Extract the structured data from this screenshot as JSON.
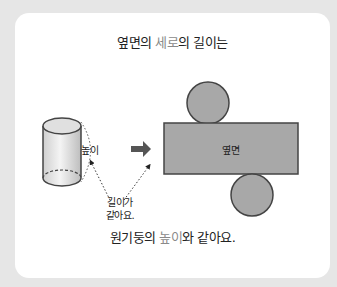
{
  "title": {
    "part1": "옆면의 ",
    "highlight": "세로",
    "part2": "의 길이는"
  },
  "labels": {
    "height": "높이",
    "same_line1": "길이가",
    "same_line2": "같아요.",
    "side_face": "옆면"
  },
  "footer": {
    "part1": "원기둥의 ",
    "highlight": "높이",
    "part2": "와 같아요."
  },
  "colors": {
    "background": "#e6e6e6",
    "card": "#ffffff",
    "highlight": "#8a8a8a",
    "net_fill": "#a8a8a8",
    "net_stroke": "#444444"
  }
}
